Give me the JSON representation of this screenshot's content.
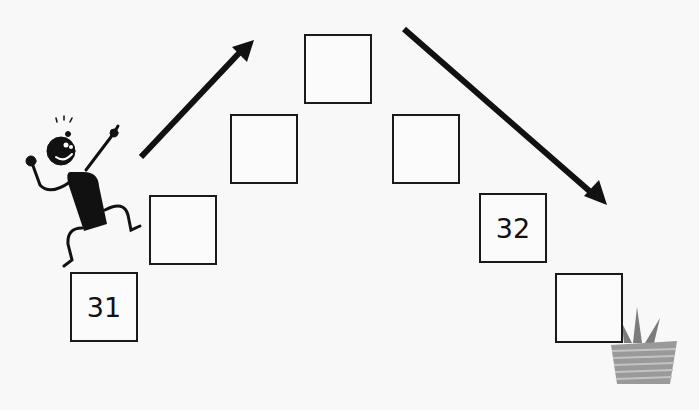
{
  "worksheet": {
    "boxes": [
      {
        "id": 1,
        "value": "31",
        "x": 70,
        "y": 272
      },
      {
        "id": 2,
        "value": "",
        "x": 149,
        "y": 195
      },
      {
        "id": 3,
        "value": "",
        "x": 230,
        "y": 114
      },
      {
        "id": 4,
        "value": "",
        "x": 304,
        "y": 34
      },
      {
        "id": 5,
        "value": "",
        "x": 392,
        "y": 114
      },
      {
        "id": 6,
        "value": "32",
        "x": 479,
        "y": 193
      },
      {
        "id": 7,
        "value": "",
        "x": 555,
        "y": 273
      }
    ],
    "arrows": [
      {
        "name": "up-arrow",
        "direction": "up-right"
      },
      {
        "name": "down-arrow",
        "direction": "down-right"
      }
    ],
    "colors": {
      "ink": "#111111",
      "gift": "#8a8a8a",
      "background": "#f8f8f8"
    }
  }
}
